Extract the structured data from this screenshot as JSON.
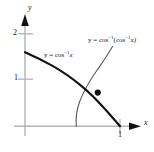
{
  "figure": {
    "name": "inverse-cosine-composition-graph",
    "background": "#ffffff",
    "width": 154,
    "height": 152
  },
  "axes": {
    "x_label": "x",
    "y_label": "y",
    "axis_color": "#b3b3b3",
    "tick_color": "#b3b3b3",
    "origin_px": [
      25,
      126
    ],
    "unit_px_x": 95,
    "unit_px_y": 47,
    "x_ticks": [
      {
        "label": "1",
        "value": 1
      }
    ],
    "y_ticks": [
      {
        "label": "1",
        "value": 1
      },
      {
        "label": "2",
        "value": 2
      }
    ]
  },
  "labels": {
    "left_curve": {
      "prefix": "y = cos",
      "exponent": "−1",
      "suffix": "x"
    },
    "right_curve": {
      "prefix": "y = cos",
      "exponent": "−1",
      "mid": "(cos",
      "exponent2": "−1",
      "suffix": "x)"
    }
  },
  "curves": [
    {
      "name": "arccos-curve",
      "expression": "y = cos^-1 x",
      "color": "#111111",
      "stroke_width": 2.1,
      "domain": [
        0,
        1
      ],
      "range": [
        0,
        1.5708
      ],
      "path": "M 25,52.2 C 35,56.5 44,61.1 53,66.2 C 63,71.9 72,78.3 81,85.6 C 90,93.0 97,100.2 104,108.0 C 110,114.5 115,120.6 120,126.2"
    },
    {
      "name": "arccos-of-arccos-curve",
      "expression": "y = cos^-1(cos^-1 x)",
      "color": "#5a5a5a",
      "stroke_width": 1.1,
      "domain": [
        0.5403,
        1
      ],
      "range": [
        0,
        1.5708
      ],
      "path": "M 76.3,126.2 C 75.6,118 76.6,110 79.5,102 C 83.5,91.5 89.5,81 96.5,71 C 102,63 107.5,55.5 112.5,46.5"
    }
  ],
  "points": [
    {
      "name": "intersection-point",
      "x_px": 97.8,
      "y_px": 92.6,
      "radius": 3.1,
      "color": "#111111"
    }
  ]
}
